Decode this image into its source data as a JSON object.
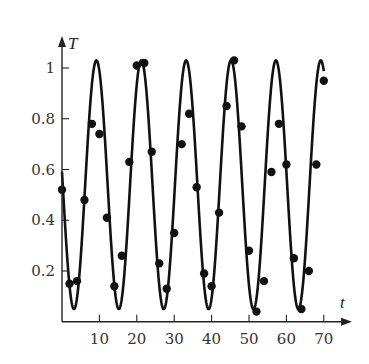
{
  "chart_data": {
    "type": "scatter",
    "title": "",
    "xlabel": "t",
    "ylabel": "T",
    "xlim": [
      0,
      75
    ],
    "ylim": [
      0,
      1.1
    ],
    "grid": false,
    "legend": null,
    "x_ticks": [
      10,
      20,
      30,
      40,
      50,
      60,
      70
    ],
    "x_tick_labels": [
      "10",
      "20",
      "30",
      "40",
      "50",
      "60",
      "70"
    ],
    "y_ticks": [
      0.2,
      0.4,
      0.6,
      0.8,
      1
    ],
    "y_tick_labels": [
      "0.2",
      "0.4",
      "0.6",
      "0.8",
      "1"
    ],
    "series": [
      {
        "name": "measured",
        "kind": "points",
        "x": [
          0,
          2,
          4,
          6,
          8,
          10,
          12,
          14,
          16,
          18,
          20,
          22,
          24,
          26,
          28,
          30,
          32,
          34,
          36,
          38,
          40,
          42,
          44,
          46,
          48,
          50,
          52,
          54,
          56,
          58,
          60,
          62,
          64,
          66,
          68,
          70
        ],
        "values": [
          0.52,
          0.15,
          0.16,
          0.48,
          0.78,
          0.74,
          0.41,
          0.14,
          0.26,
          0.63,
          1.01,
          1.02,
          0.67,
          0.23,
          0.13,
          0.35,
          0.7,
          0.82,
          0.53,
          0.19,
          0.14,
          0.43,
          0.85,
          1.03,
          0.77,
          0.28,
          0.04,
          0.16,
          0.59,
          0.78,
          0.62,
          0.25,
          0.05,
          0.2,
          0.62,
          0.95
        ]
      },
      {
        "name": "fitted curve",
        "kind": "line",
        "formula": "T = 0.54 + 0.49*cos(2*pi*(t - 9.2)/12.0)",
        "t_range": [
          0,
          70
        ],
        "offset": 0.54,
        "amplitude": 0.49,
        "period": 12.0,
        "peak_t": 9.2
      }
    ]
  },
  "layout": {
    "origin_px": [
      62,
      321.75
    ],
    "px_per_t": 3.74,
    "px_per_T": 253.75,
    "x_axis_end_px": 352,
    "y_axis_top_px": 36,
    "point_radius": 4.2,
    "line_color": "#111111",
    "point_color": "#111111",
    "axis_color": "#222222"
  }
}
